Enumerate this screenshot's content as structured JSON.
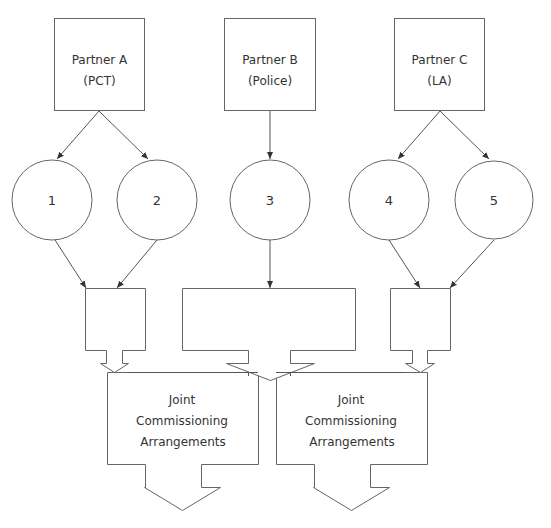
{
  "diagram": {
    "partners": [
      {
        "name": "Partner A",
        "org": "(PCT)"
      },
      {
        "name": "Partner B",
        "org": "(Police)"
      },
      {
        "name": "Partner C",
        "org": "(LA)"
      }
    ],
    "circles": [
      "1",
      "2",
      "3",
      "4",
      "5"
    ],
    "joint_boxes": [
      {
        "line1": "Joint",
        "line2": "Commissioning",
        "line3": "Arrangements"
      },
      {
        "line1": "Joint",
        "line2": "Commissioning",
        "line3": "Arrangements"
      }
    ],
    "edges": [
      {
        "from": "Partner A",
        "to": "1"
      },
      {
        "from": "Partner A",
        "to": "2"
      },
      {
        "from": "Partner B",
        "to": "3"
      },
      {
        "from": "Partner C",
        "to": "4"
      },
      {
        "from": "Partner C",
        "to": "5"
      },
      {
        "from": "1",
        "to": "pool-left"
      },
      {
        "from": "2",
        "to": "pool-left"
      },
      {
        "from": "3",
        "to": "pool-middle"
      },
      {
        "from": "4",
        "to": "pool-right"
      },
      {
        "from": "5",
        "to": "pool-right"
      },
      {
        "from": "pool-left",
        "to": "Joint Commissioning Arrangements 1"
      },
      {
        "from": "pool-middle",
        "to": "Joint Commissioning Arrangements 1"
      },
      {
        "from": "pool-middle",
        "to": "Joint Commissioning Arrangements 2"
      },
      {
        "from": "pool-right",
        "to": "Joint Commissioning Arrangements 2"
      }
    ]
  }
}
